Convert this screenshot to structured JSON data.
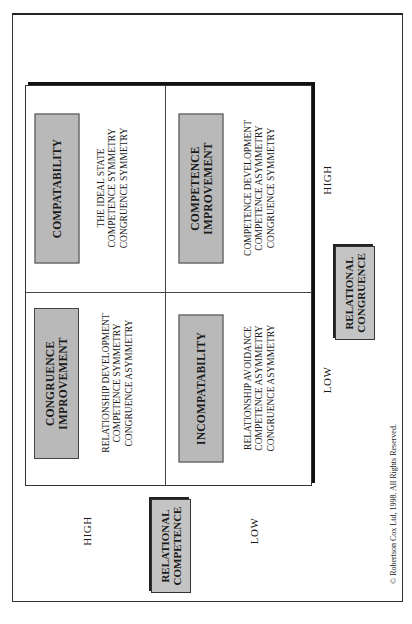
{
  "diagram": {
    "type": "2x2-matrix",
    "orientation": "rotated-90-ccw",
    "quadrants": [
      {
        "position": "high-competence-high-congruence",
        "title": "COMPATABILITY",
        "description": [
          "THE IDEAL STATE",
          "COMPETENCE SYMMETRY",
          "CONGRUENCE SYMMETRY"
        ]
      },
      {
        "position": "high-competence-low-congruence",
        "title": [
          "CONGRUENCE",
          "IMPROVEMENT"
        ],
        "description": [
          "RELATIONSHIP DEVELOPMENT",
          "COMPETENCE SYMMETRY",
          "CONGRUENCE ASYMMETRY"
        ]
      },
      {
        "position": "low-competence-high-congruence",
        "title": [
          "COMPETENCE",
          "IMPROVEMENT"
        ],
        "description": [
          "COMPETENCE DEVELOPMENT",
          "COMPETENCE ASYMMETRY",
          "CONGRUENCE SYMMETRY"
        ]
      },
      {
        "position": "low-competence-low-congruence",
        "title": "INCOMPATABILITY",
        "description": [
          "RELATIONSHIP AVOIDANCE",
          "COMPETENCE ASYMMETRY",
          "CONGRUENCE ASYMMETRY"
        ]
      }
    ],
    "axes": {
      "competence": {
        "title": [
          "RELATIONAL",
          "COMPETENCE"
        ],
        "high_label": "HIGH",
        "low_label": "LOW"
      },
      "congruence": {
        "title": [
          "RELATIONAL",
          "CONGRUENCE"
        ],
        "low_label": "LOW",
        "high_label": "HIGH"
      }
    },
    "copyright": "© Robertson Cox Ltd, 1998.   All Rights Reserved."
  },
  "colors": {
    "box_fill": "#b9b9b9",
    "border": "#333333",
    "background": "#ffffff"
  }
}
